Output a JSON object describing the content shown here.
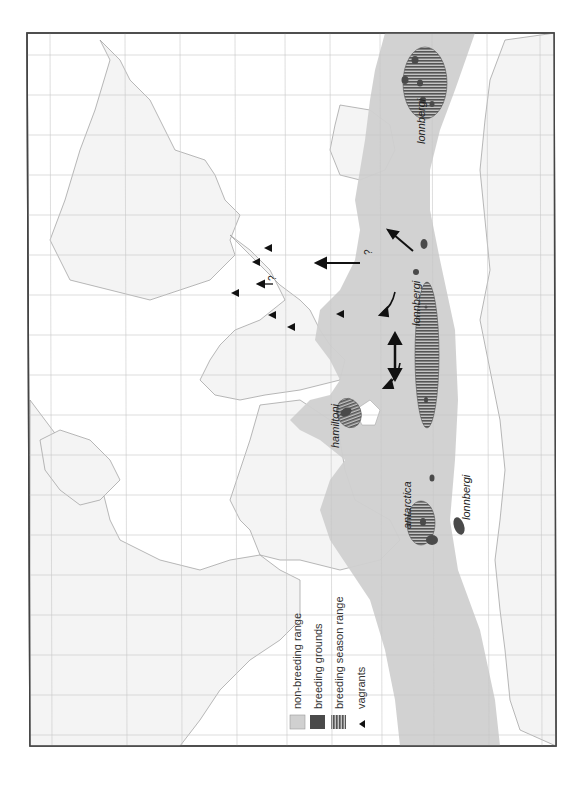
{
  "map": {
    "orientation": "rotated 90° counter-clockwise",
    "colors": {
      "background": "#ffffff",
      "frame": "#444444",
      "grid": "#c8c8c8",
      "land_fill": "#f4f4f4",
      "coastline": "#9a9a9a",
      "non_breeding_range": "#d0d0d0",
      "breeding_grounds": "#4a4a4a",
      "breeding_season_range": "#6e6e6e",
      "vagrant_marker": "#111111",
      "arrow": "#111111"
    },
    "labels": {
      "lonnbergi_1": "lonnbergi",
      "lonnbergi_2": "lonnbergi",
      "lonnbergi_3": "lonnbergi",
      "hamiltoni": "hamiltoni",
      "antarctica": "antarctica"
    },
    "question_marks": [
      "?",
      "?"
    ]
  },
  "legend": {
    "items": [
      {
        "label": "non-breeding range",
        "swatch": "light-gray-fill"
      },
      {
        "label": "breeding grounds",
        "swatch": "dark-gray-fill"
      },
      {
        "label": "breeding season range",
        "swatch": "striped-fill"
      },
      {
        "label": "vagrants",
        "swatch": "triangle-icon"
      }
    ]
  }
}
